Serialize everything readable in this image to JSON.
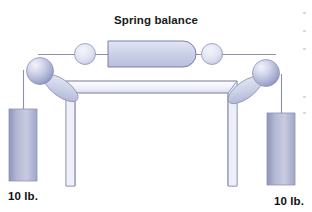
{
  "figure": {
    "title": "Spring balance",
    "title_x": 156,
    "title_y": 24,
    "background_color": "#ffffff",
    "type": "physics-apparatus-illustration"
  },
  "labels": {
    "left_weight": "10 lb.",
    "right_weight": "10 lb.",
    "left_weight_x": 8,
    "left_weight_y": 198,
    "right_weight_x": 262,
    "right_weight_y": 203
  },
  "colors": {
    "outline": "#6e72a0",
    "outline_soft": "#9093b5",
    "cord": "#8c90ad",
    "fill_light": "#f2f3f9",
    "fill_mid": "#c9cde4",
    "fill_deep": "#9aa0c6",
    "sphere_highlight": "#e8eaf5",
    "sphere_shadow": "#8d93bd",
    "weight_block_light": "#c3c7de",
    "weight_block_dark": "#8f94bb",
    "text": "#111111",
    "background": "#ffffff"
  },
  "parts": {
    "spring_balance_bar": {
      "name": "spring-balance-bar",
      "x": 108,
      "y": 41,
      "width": 87,
      "height": 26,
      "right_end": "rounded",
      "left_end": "flat"
    },
    "horizontal_cord": {
      "name": "horizontal-cord",
      "y": 54,
      "x_start": 38,
      "x_end": 275
    },
    "left_small_ring": {
      "cx": 85,
      "cy": 54,
      "r": 10.5
    },
    "right_small_ring": {
      "cx": 212,
      "cy": 54,
      "r": 10.5
    },
    "left_pulley_sphere": {
      "cx": 40,
      "cy": 71,
      "r": 13.5
    },
    "right_pulley_sphere": {
      "cx": 266,
      "cy": 73,
      "r": 13.5
    },
    "left_arm": {
      "x1": 48,
      "y1": 78,
      "x2": 75,
      "y2": 98,
      "thickness": 13
    },
    "right_arm": {
      "x1": 258,
      "y1": 80,
      "x2": 231,
      "y2": 99,
      "thickness": 13
    },
    "left_weight_block": {
      "x": 9,
      "y": 109,
      "width": 28,
      "height": 72
    },
    "right_weight_block": {
      "x": 267,
      "y": 113,
      "width": 28,
      "height": 72
    },
    "left_vertical_cord": {
      "x": 23,
      "y_top": 72,
      "y_bottom": 109
    },
    "right_vertical_cord": {
      "x": 281,
      "y_top": 75,
      "y_bottom": 113
    },
    "stand": {
      "name": "table-stand",
      "top_plate_front_left_x": 75,
      "top_plate_front_right_x": 228,
      "top_plate_y": 93,
      "top_plate_back_left_x": 82,
      "top_plate_back_right_x": 221,
      "top_plate_back_y": 80,
      "left_leg_bottom_x": 66,
      "right_leg_bottom_x": 237,
      "leg_bottom_y": 186
    }
  }
}
